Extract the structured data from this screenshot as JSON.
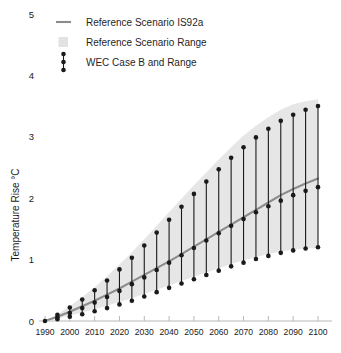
{
  "chart_data": {
    "type": "line",
    "title": "",
    "xlabel": "",
    "ylabel": "Temperature Rise °C",
    "xlim": [
      1990,
      2100
    ],
    "ylim": [
      0,
      5
    ],
    "grid": false,
    "legend_position": "top-left",
    "x_ticks": [
      1990,
      2000,
      2010,
      2020,
      2030,
      2040,
      2050,
      2060,
      2070,
      2080,
      2090,
      2100
    ],
    "y_ticks": [
      0,
      1,
      2,
      3,
      4,
      5
    ],
    "legend": [
      {
        "label": "Reference Scenario IS92a",
        "marker": "line",
        "color": "#8c8c8c"
      },
      {
        "label": "Reference Scenario Range",
        "marker": "square",
        "color": "#e2e2e2"
      },
      {
        "label": "WEC Case B and Range",
        "marker": "errorbar",
        "color": "#1a1a1a"
      }
    ],
    "series": [
      {
        "name": "Reference Scenario IS92a",
        "type": "line",
        "color": "#8c8c8c",
        "x": [
          1990,
          1995,
          2000,
          2005,
          2010,
          2015,
          2020,
          2025,
          2030,
          2035,
          2040,
          2045,
          2050,
          2055,
          2060,
          2065,
          2070,
          2075,
          2080,
          2085,
          2090,
          2095,
          2100
        ],
        "values": [
          0.0,
          0.07,
          0.15,
          0.24,
          0.33,
          0.43,
          0.53,
          0.64,
          0.75,
          0.86,
          0.97,
          1.09,
          1.21,
          1.33,
          1.45,
          1.57,
          1.69,
          1.81,
          1.93,
          2.05,
          2.15,
          2.24,
          2.32
        ]
      },
      {
        "name": "Reference Scenario Range",
        "type": "band",
        "color": "#e6e6e6",
        "x": [
          1990,
          1995,
          2000,
          2005,
          2010,
          2015,
          2020,
          2025,
          2030,
          2035,
          2040,
          2045,
          2050,
          2055,
          2060,
          2065,
          2070,
          2075,
          2080,
          2085,
          2090,
          2095,
          2100
        ],
        "lower": [
          0.0,
          0.04,
          0.09,
          0.14,
          0.19,
          0.25,
          0.31,
          0.37,
          0.44,
          0.51,
          0.58,
          0.65,
          0.72,
          0.79,
          0.86,
          0.93,
          0.99,
          1.04,
          1.09,
          1.13,
          1.16,
          1.18,
          1.19
        ],
        "upper": [
          0.0,
          0.11,
          0.24,
          0.39,
          0.55,
          0.73,
          0.92,
          1.12,
          1.33,
          1.55,
          1.77,
          1.99,
          2.21,
          2.42,
          2.63,
          2.83,
          3.02,
          3.18,
          3.32,
          3.44,
          3.53,
          3.58,
          3.61
        ]
      },
      {
        "name": "WEC Case B and Range",
        "type": "errorbar",
        "color": "#1a1a1a",
        "x": [
          1995,
          2000,
          2005,
          2010,
          2015,
          2020,
          2025,
          2030,
          2035,
          2040,
          2045,
          2050,
          2055,
          2060,
          2065,
          2070,
          2075,
          2080,
          2085,
          2090,
          2095,
          2100
        ],
        "low": [
          0.03,
          0.07,
          0.11,
          0.16,
          0.21,
          0.27,
          0.33,
          0.4,
          0.47,
          0.54,
          0.61,
          0.68,
          0.75,
          0.82,
          0.89,
          0.95,
          1.01,
          1.06,
          1.11,
          1.15,
          1.18,
          1.2
        ],
        "mid": [
          0.06,
          0.13,
          0.21,
          0.3,
          0.39,
          0.49,
          0.6,
          0.71,
          0.83,
          0.95,
          1.07,
          1.19,
          1.31,
          1.43,
          1.55,
          1.66,
          1.77,
          1.87,
          1.96,
          2.05,
          2.12,
          2.18
        ],
        "high": [
          0.1,
          0.22,
          0.35,
          0.5,
          0.66,
          0.84,
          1.03,
          1.23,
          1.44,
          1.65,
          1.86,
          2.07,
          2.27,
          2.47,
          2.66,
          2.83,
          2.99,
          3.13,
          3.26,
          3.36,
          3.44,
          3.5
        ]
      }
    ]
  }
}
